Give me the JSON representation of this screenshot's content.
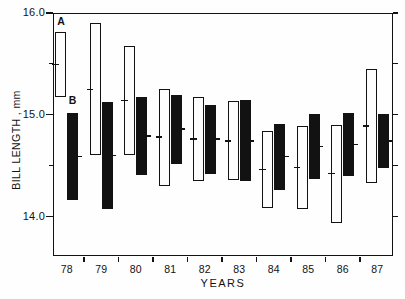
{
  "figure": {
    "series_label_a": "A",
    "series_label_b": "B"
  },
  "chart_data": {
    "type": "bar",
    "subtype": "paired-vertical-range-bars-with-midpoint-ticks",
    "title": "",
    "xlabel": "YEARS",
    "ylabel": "BILL LENGTH , mm",
    "ylim": [
      13.6,
      16.0
    ],
    "ytick_interval": 0.5,
    "yticks_major": [
      16.0,
      15.0,
      14.0
    ],
    "yticks_minor": [
      15.5,
      14.5
    ],
    "yticks_right": [
      16.0,
      15.5,
      15.0,
      14.5,
      14.0
    ],
    "ytick_labels": [
      {
        "text": "16.0",
        "value": 16.0
      },
      {
        "text": "15.0",
        "value": 15.0
      },
      {
        "text": "14.0",
        "value": 14.0
      }
    ],
    "grid": false,
    "legend_position": "A and B labels above first pair of bars",
    "categories": [
      "78",
      "79",
      "80",
      "81",
      "82",
      "83",
      "84",
      "85",
      "86",
      "87"
    ],
    "series": [
      {
        "name": "A",
        "style": "open",
        "ranges": [
          [
            15.17,
            15.81
          ],
          [
            14.6,
            15.9
          ],
          [
            14.6,
            15.67
          ],
          [
            14.3,
            15.25
          ],
          [
            14.35,
            15.17
          ],
          [
            14.36,
            15.13
          ],
          [
            14.08,
            14.84
          ],
          [
            14.07,
            14.89
          ],
          [
            13.94,
            14.9
          ],
          [
            14.33,
            15.45
          ]
        ],
        "midpoints": [
          15.49,
          15.25,
          15.14,
          14.78,
          14.76,
          14.74,
          14.46,
          14.48,
          14.42,
          14.89
        ]
      },
      {
        "name": "B",
        "style": "filled",
        "ranges": [
          [
            14.16,
            15.02
          ],
          [
            14.07,
            15.12
          ],
          [
            14.41,
            15.17
          ],
          [
            14.52,
            15.19
          ],
          [
            14.42,
            15.1
          ],
          [
            14.35,
            15.14
          ],
          [
            14.26,
            14.91
          ],
          [
            14.37,
            15.01
          ],
          [
            14.4,
            15.02
          ],
          [
            14.48,
            15.01
          ]
        ],
        "midpoints": [
          14.59,
          14.6,
          14.79,
          14.86,
          14.76,
          14.74,
          14.59,
          14.69,
          14.71,
          14.74
        ]
      }
    ]
  }
}
